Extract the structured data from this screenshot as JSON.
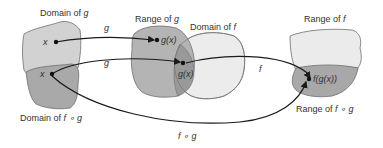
{
  "colors": {
    "domain_g": "#d2d2d2",
    "domain_fog": "#a9a9a9",
    "range_g": "#b4b4b4",
    "domain_f": "#ececec",
    "overlap": "#999999",
    "range_f": "#ebebeb",
    "range_fog": "#a8a8a8",
    "outline": "#6e6e6e",
    "arrow": "#1a1a1a"
  },
  "labels": {
    "domain_g_prefix": "Domain of ",
    "domain_g_var": "g",
    "range_g_prefix": "Range of ",
    "range_g_var": "g",
    "domain_f_prefix": "Domain of ",
    "domain_f_var": "f",
    "range_f_prefix": "Range of ",
    "range_f_var": "f",
    "domain_fog_prefix": "Domain of ",
    "domain_fog_var": "f ∘ g",
    "range_fog_prefix": "Range of ",
    "range_fog_var": "f ∘ g"
  },
  "points": {
    "x_top": "x",
    "x_bottom": "x",
    "gx_top": "g(x)",
    "gx_overlap": "g(x)",
    "fgx": "f(g(x))"
  },
  "arrows": {
    "g_top": "g",
    "g_bottom": "g",
    "f": "f",
    "fog": "f ∘ g"
  }
}
